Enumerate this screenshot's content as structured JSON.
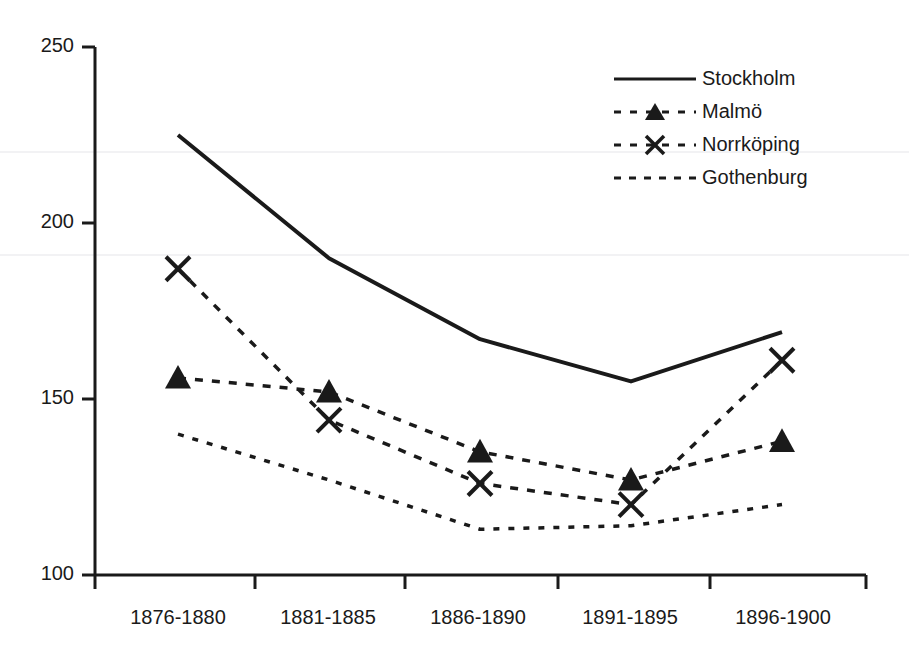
{
  "chart_data": {
    "type": "line",
    "title": "",
    "subtitle": "",
    "xlabel": "",
    "ylabel": "",
    "categories": [
      "1876-1880",
      "1881-1885",
      "1886-1890",
      "1891-1895",
      "1896-1900"
    ],
    "series": [
      {
        "name": "Stockholm",
        "style": "solid",
        "marker": "none",
        "color": "#1a1a1a",
        "values": [
          225,
          190,
          167,
          155,
          169
        ]
      },
      {
        "name": "Malmö",
        "style": "dashed",
        "marker": "triangle",
        "color": "#1a1a1a",
        "values": [
          156,
          152,
          135,
          127,
          138
        ]
      },
      {
        "name": "Norrköping",
        "style": "dashed",
        "marker": "x",
        "color": "#1a1a1a",
        "values": [
          187,
          144,
          126,
          120,
          161
        ]
      },
      {
        "name": "Gothenburg",
        "style": "dotted",
        "marker": "none",
        "color": "#1a1a1a",
        "values": [
          140,
          127,
          113,
          114,
          120
        ]
      }
    ],
    "ylim": [
      100,
      250
    ],
    "yticks": [
      100,
      150,
      200,
      250
    ],
    "ytick_labels": [
      "100",
      "150",
      "200",
      "250"
    ],
    "grid": false,
    "legend_position": "top-right"
  },
  "axes": {
    "y_tick_labels": [
      "250",
      "200",
      "150",
      "100"
    ],
    "x_tick_labels": [
      "1876-1880",
      "1881-1885",
      "1886-1890",
      "1891-1895",
      "1896-1900"
    ]
  },
  "legend": {
    "items": [
      {
        "label": "Stockholm",
        "key": "solid-line-key"
      },
      {
        "label": "Malmö",
        "key": "dashed-triangle-key"
      },
      {
        "label": "Norrköping",
        "key": "dashed-x-key"
      },
      {
        "label": "Gothenburg",
        "key": "dotted-line-key"
      }
    ]
  }
}
